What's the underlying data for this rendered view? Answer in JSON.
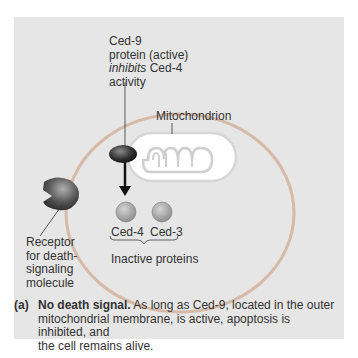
{
  "figure": {
    "labels": {
      "ced9_line1": "Ced-9",
      "ced9_line2": "protein (active)",
      "ced9_line3_italic": "inhibits",
      "ced9_line3_rest": " Ced-4",
      "ced9_line4": "activity",
      "mitochondrion": "Mitochondrion",
      "ced4": "Ced-4",
      "ced3": "Ced-3",
      "inactive_proteins": "Inactive proteins",
      "receptor_l1": "Receptor",
      "receptor_l2": "for death-",
      "receptor_l3": "signaling",
      "receptor_l4": "molecule"
    },
    "caption": {
      "tag": "(a)",
      "title": "No death signal.",
      "text_l1": " As long as Ced-9, located in the outer",
      "text_l2": "mitochondrial membrane, is active, apoptosis is inhibited, and",
      "text_l3": "the cell remains alive."
    },
    "colors": {
      "panel_bg": "#e6e6e6",
      "cell_membrane": "#d4b8a4",
      "mitochondrion_fill": "#ffffff",
      "protein_gray": "#9a9a9a",
      "ced9_dark": "#2a2a2a"
    }
  }
}
